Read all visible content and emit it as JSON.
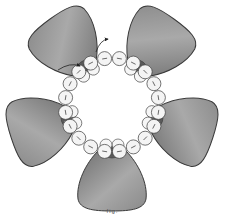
{
  "diagram": {
    "caption": "fig.",
    "colors": {
      "petal_fill_light": "#a8a8a8",
      "petal_fill_dark": "#6a6a6a",
      "petal_stroke": "#3a3a3a",
      "bead_fill": "#f4f4f4",
      "bead_stroke": "#3a3a3a",
      "center_bead_fill": "#5a5a5a",
      "thread": "#222222",
      "background": "#ffffff"
    },
    "center": {
      "x": 112,
      "y": 105
    },
    "petals": [
      {
        "id": "petal-top-left",
        "angle": -126
      },
      {
        "id": "petal-top-right",
        "angle": -54
      },
      {
        "id": "petal-right",
        "angle": 18
      },
      {
        "id": "petal-bottom",
        "angle": 90
      },
      {
        "id": "petal-left",
        "angle": 162
      }
    ],
    "ring_bead_count": 20,
    "ring_radius": 47,
    "bead_radius": 7,
    "thread_path_arrows": 2
  }
}
